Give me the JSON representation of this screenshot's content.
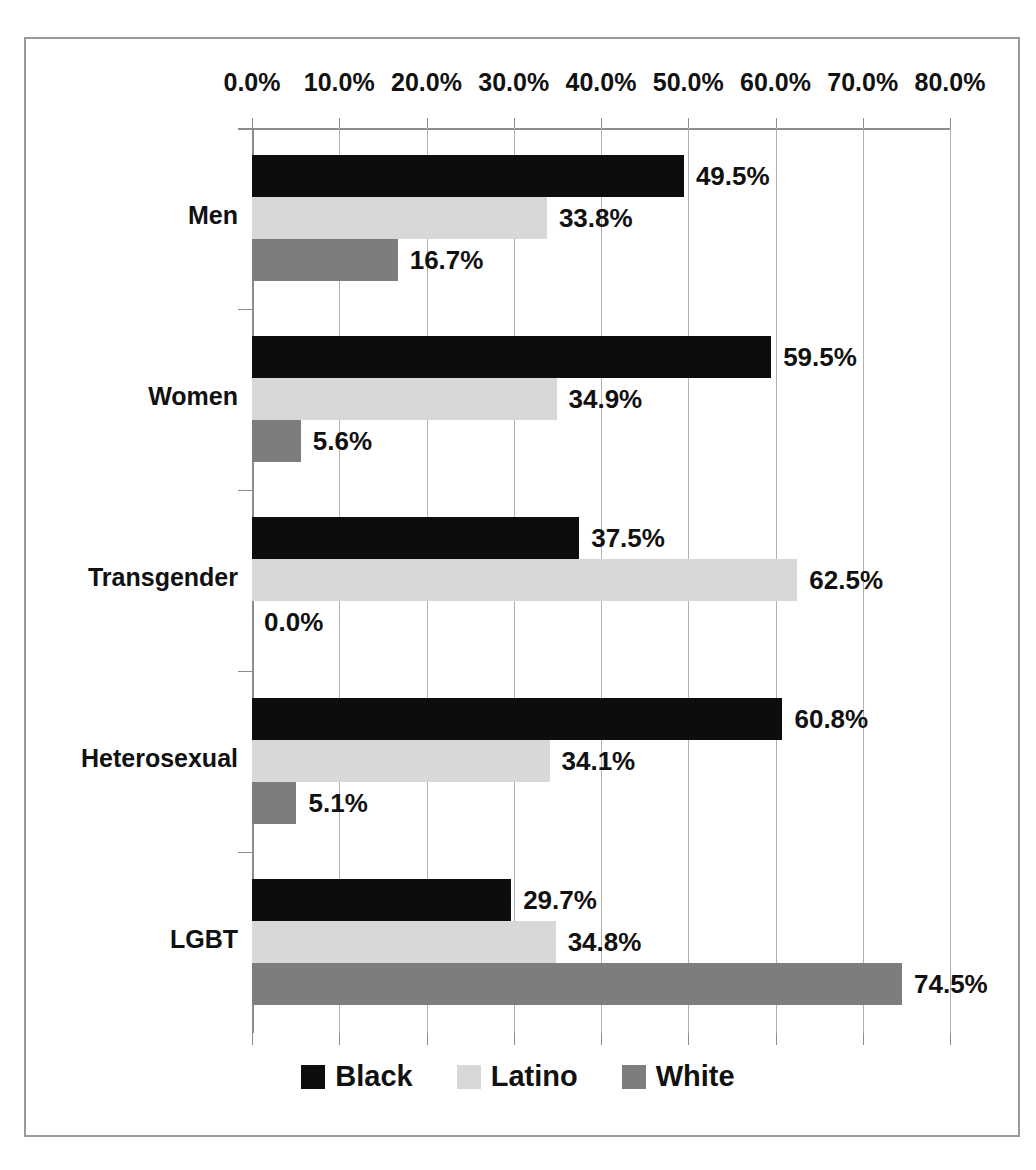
{
  "title_partial": "",
  "chart_data": {
    "type": "bar",
    "orientation": "horizontal",
    "title": "",
    "xlabel": "",
    "ylabel": "",
    "xlim": [
      0,
      80
    ],
    "xtick_labels": [
      "0.0%",
      "10.0%",
      "20.0%",
      "30.0%",
      "40.0%",
      "50.0%",
      "60.0%",
      "70.0%",
      "80.0%"
    ],
    "xtick_values": [
      0,
      10,
      20,
      30,
      40,
      50,
      60,
      70,
      80
    ],
    "grid": true,
    "legend_position": "bottom",
    "categories": [
      "Men",
      "Women",
      "Transgender",
      "Heterosexual",
      "LGBT"
    ],
    "series": [
      {
        "name": "Black",
        "color": "#0d0d0d",
        "values": [
          49.5,
          59.5,
          37.5,
          60.8,
          29.7
        ],
        "labels": [
          "49.5%",
          "59.5%",
          "37.5%",
          "60.8%",
          "29.7%"
        ]
      },
      {
        "name": "Latino",
        "color": "#d8d8d8",
        "values": [
          33.8,
          34.9,
          62.5,
          34.1,
          34.8
        ],
        "labels": [
          "33.8%",
          "34.9%",
          "62.5%",
          "34.1%",
          "34.8%"
        ]
      },
      {
        "name": "White",
        "color": "#7d7d7d",
        "values": [
          16.7,
          5.6,
          0.0,
          5.1,
          74.5
        ],
        "labels": [
          "16.7%",
          "5.6%",
          "0.0%",
          "5.1%",
          "74.5%"
        ]
      }
    ]
  },
  "legend": {
    "items": [
      {
        "label": "Black",
        "color": "#0d0d0d"
      },
      {
        "label": "Latino",
        "color": "#d8d8d8"
      },
      {
        "label": "White",
        "color": "#7d7d7d"
      }
    ]
  },
  "colors": {
    "black_series": "#0d0d0d",
    "latino_series": "#d8d8d8",
    "white_series": "#7d7d7d",
    "gridline": "#b0b0b0",
    "axis": "#8c8c8c",
    "frame_border": "#9a9a9a",
    "text": "#111111",
    "background": "#ffffff"
  }
}
